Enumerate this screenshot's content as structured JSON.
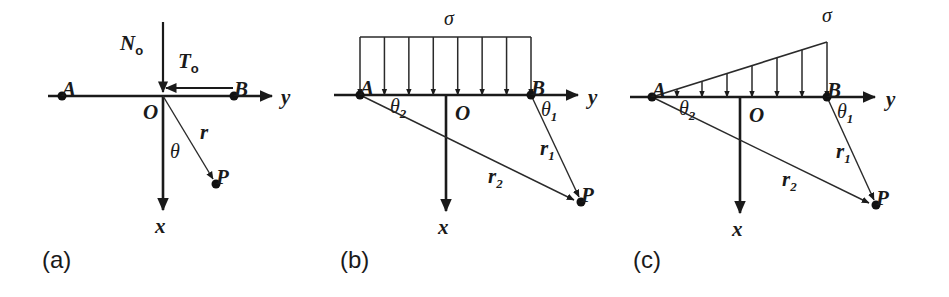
{
  "figure": {
    "width": 949,
    "height": 297,
    "background": "#ffffff",
    "ink_color": "#1a1a1a"
  },
  "panels": [
    {
      "id": "a",
      "caption": "(a)",
      "caption_pos": {
        "x": 42,
        "y": 268
      },
      "origin": {
        "x": 163,
        "y": 96
      },
      "point_a": {
        "x": 62,
        "y": 96,
        "label": "A",
        "label_pos": {
          "x": 50,
          "y": 77
        }
      },
      "point_b": {
        "x": 234,
        "y": 96,
        "label": "B",
        "label_pos": {
          "x": 242,
          "y": 78
        }
      },
      "point_p": {
        "x": 216,
        "y": 184,
        "label": "P",
        "label_pos": {
          "x": 228,
          "y": 203
        }
      },
      "origin_label": {
        "text": "O",
        "x": 143,
        "y": 119
      },
      "y_axis": {
        "x1": 48,
        "x2": 272,
        "y": 96,
        "label": "y",
        "label_pos": {
          "x": 281,
          "y": 104
        }
      },
      "x_axis": {
        "x": 163,
        "y1": 96,
        "y2": 210,
        "label": "x",
        "label_pos": {
          "x": 155,
          "y": 233
        }
      },
      "radius_ray": {
        "label": "r",
        "label_pos": {
          "x": 200,
          "y": 139
        }
      },
      "theta_label": {
        "text": "θ",
        "x": 170,
        "y": 158
      },
      "load_normal": {
        "label": "N",
        "sub": "o",
        "label_pos": {
          "x": 120,
          "y": 50
        },
        "x": 163,
        "y1": 22,
        "y2": 92
      },
      "load_shear": {
        "label": "T",
        "sub": "o",
        "label_pos": {
          "x": 178,
          "y": 68
        },
        "x1": 233,
        "x2": 166,
        "y": 88
      }
    },
    {
      "id": "b",
      "caption": "(b)",
      "caption_pos": {
        "x": 340,
        "y": 268
      },
      "origin": {
        "x": 446,
        "y": 95
      },
      "point_a": {
        "x": 360,
        "y": 95,
        "label": "A",
        "label_pos": {
          "x": 341,
          "y": 78
        }
      },
      "point_b": {
        "x": 531,
        "y": 95,
        "label": "B",
        "label_pos": {
          "x": 540,
          "y": 78
        }
      },
      "point_p": {
        "x": 581,
        "y": 202,
        "label": "P",
        "label_pos": {
          "x": 594,
          "y": 216
        }
      },
      "origin_label": {
        "text": "O",
        "x": 455,
        "y": 120
      },
      "y_axis": {
        "x1": 334,
        "x2": 578,
        "y": 95,
        "label": "y",
        "label_pos": {
          "x": 588,
          "y": 104
        }
      },
      "x_axis": {
        "x": 446,
        "y1": 95,
        "y2": 211,
        "label": "x",
        "label_pos": {
          "x": 438,
          "y": 234
        }
      },
      "r1": {
        "label": "r",
        "sub": "1",
        "label_pos": {
          "x": 540,
          "y": 155
        }
      },
      "r2": {
        "label": "r",
        "sub": "2",
        "label_pos": {
          "x": 488,
          "y": 183
        }
      },
      "theta1": {
        "label": "θ",
        "sub": "1",
        "label_pos": {
          "x": 541,
          "y": 116
        }
      },
      "theta2": {
        "label": "θ",
        "sub": "2",
        "label_pos": {
          "x": 390,
          "y": 113
        }
      },
      "load": {
        "type": "uniform",
        "symbol": "σ",
        "symbol_pos": {
          "x": 444,
          "y": 25
        },
        "bar_y": 37,
        "bar_x1": 360,
        "bar_x2": 531,
        "arrow_count": 8,
        "arrow_tip_y": 95
      }
    },
    {
      "id": "c",
      "caption": "(c)",
      "caption_pos": {
        "x": 633,
        "y": 268
      },
      "origin": {
        "x": 740,
        "y": 97
      },
      "point_a": {
        "x": 652,
        "y": 97,
        "label": "A",
        "label_pos": {
          "x": 632,
          "y": 78
        }
      },
      "point_b": {
        "x": 827,
        "y": 97,
        "label": "B",
        "label_pos": {
          "x": 836,
          "y": 78
        }
      },
      "point_p": {
        "x": 876,
        "y": 205,
        "label": "P",
        "label_pos": {
          "x": 890,
          "y": 218
        }
      },
      "origin_label": {
        "text": "O",
        "x": 749,
        "y": 122
      },
      "y_axis": {
        "x1": 630,
        "x2": 875,
        "y": 97,
        "label": "y",
        "label_pos": {
          "x": 886,
          "y": 106
        }
      },
      "x_axis": {
        "x": 740,
        "y1": 97,
        "y2": 213,
        "label": "x",
        "label_pos": {
          "x": 732,
          "y": 236
        }
      },
      "r1": {
        "label": "r",
        "sub": "1",
        "label_pos": {
          "x": 836,
          "y": 158
        }
      },
      "r2": {
        "label": "r",
        "sub": "2",
        "label_pos": {
          "x": 782,
          "y": 186
        }
      },
      "theta1": {
        "label": "θ",
        "sub": "1",
        "label_pos": {
          "x": 837,
          "y": 118
        }
      },
      "theta2": {
        "label": "θ",
        "sub": "2",
        "label_pos": {
          "x": 679,
          "y": 115
        }
      },
      "load": {
        "type": "triangular",
        "symbol": "σ",
        "symbol_pos": {
          "x": 822,
          "y": 22
        },
        "apex_x": 827,
        "apex_y": 42,
        "base_x": 652,
        "arrow_count": 6,
        "arrow_tip_y": 97
      }
    }
  ],
  "geometry_notes": {
    "dot_radius": 4.5,
    "arrow_head_length": 9,
    "arrow_head_width": 7
  }
}
